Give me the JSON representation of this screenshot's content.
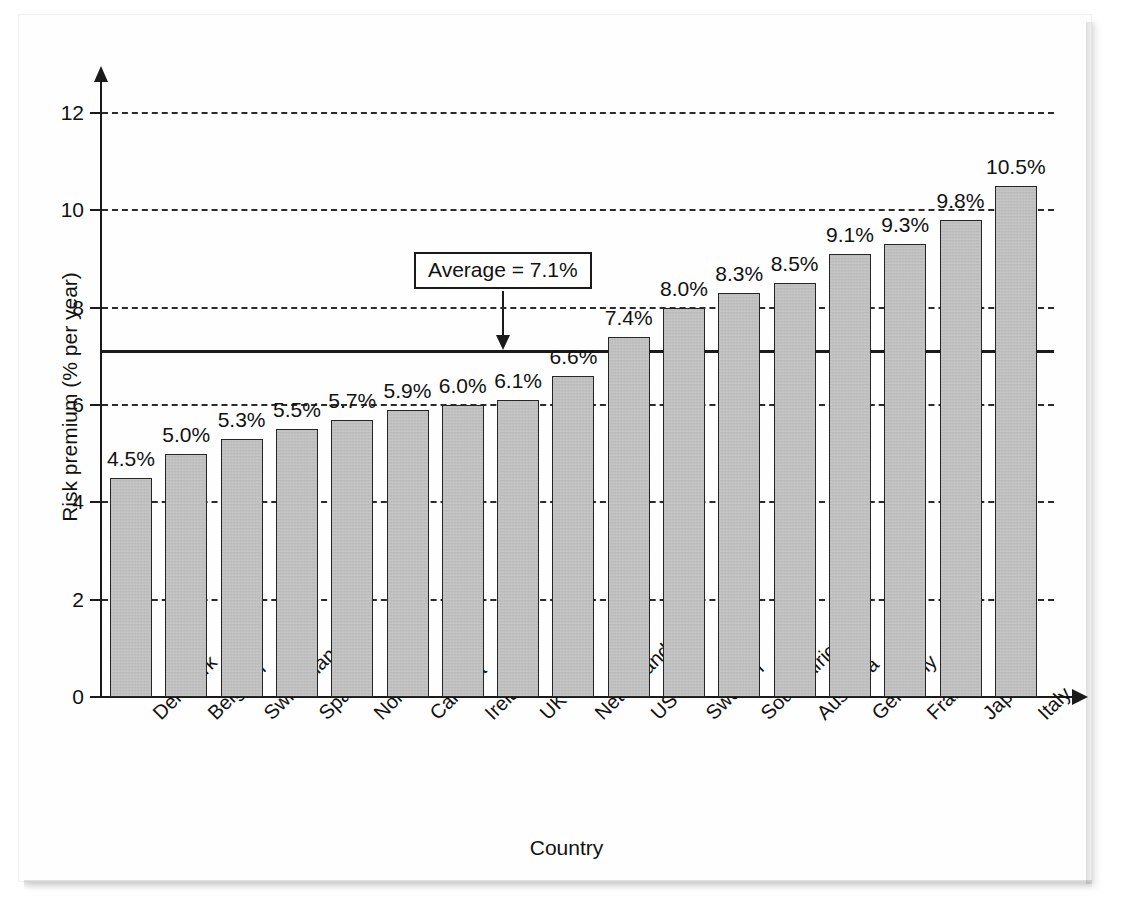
{
  "chart_data": {
    "type": "bar",
    "title": "",
    "xlabel": "Country",
    "ylabel": "Risk premium (% per year)",
    "ylim": [
      0,
      12
    ],
    "ytick_values": [
      0,
      2,
      4,
      6,
      8,
      10,
      12
    ],
    "ytick_labels": [
      "0",
      "2",
      "4",
      "6",
      "8",
      "10",
      "12"
    ],
    "grid": "horizontal-dashed",
    "legend": "none",
    "categories": [
      "Denmark",
      "Belgium",
      "Switzerland",
      "Spain",
      "Norway",
      "Canada",
      "Ireland",
      "UK",
      "Netherlands",
      "US",
      "Sweden",
      "South Africa",
      "Australia",
      "Germany",
      "France",
      "Japan",
      "Italy"
    ],
    "values": [
      4.5,
      5.0,
      5.3,
      5.5,
      5.7,
      5.9,
      6.0,
      6.1,
      6.6,
      7.4,
      8.0,
      8.3,
      8.5,
      9.1,
      9.3,
      9.8,
      10.5
    ],
    "value_labels": [
      "4.5%",
      "5.0%",
      "5.3%",
      "5.5%",
      "5.7%",
      "5.9%",
      "6.0%",
      "6.1%",
      "6.6%",
      "7.4%",
      "8.0%",
      "8.3%",
      "8.5%",
      "9.1%",
      "9.3%",
      "9.8%",
      "10.5%"
    ],
    "annotations": [
      {
        "name": "average-callout",
        "label": "Average = 7.1%",
        "value": 7.1
      }
    ],
    "colors": {
      "bar_fill": "#b4b4b4",
      "bar_stroke": "#262626",
      "axis": "#1a1a1a",
      "grid": "#2b2b2b",
      "text": "#111111",
      "background": "#ffffff"
    }
  }
}
